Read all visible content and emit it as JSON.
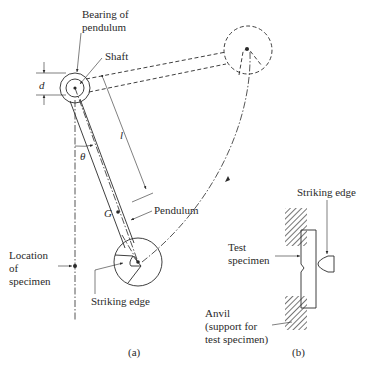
{
  "figure_a": {
    "caption": "(a)",
    "labels": {
      "bearing_line1": "Bearing of",
      "bearing_line2": "pendulum",
      "shaft": "Shaft",
      "d": "d",
      "l": "l",
      "theta": "θ",
      "G": "G",
      "pendulum": "Pendulum",
      "location_line1": "Location",
      "location_line2": "of",
      "location_line3": "specimen",
      "striking_edge": "Striking edge"
    }
  },
  "figure_b": {
    "caption": "(b)",
    "labels": {
      "striking_edge": "Striking edge",
      "test_line1": "Test",
      "test_line2": "specimen",
      "anvil_line1": "Anvil",
      "anvil_line2": "(support for",
      "anvil_line3": "test specimen)"
    }
  },
  "colors": {
    "ink": "#2a2a2a",
    "background": "#ffffff"
  }
}
